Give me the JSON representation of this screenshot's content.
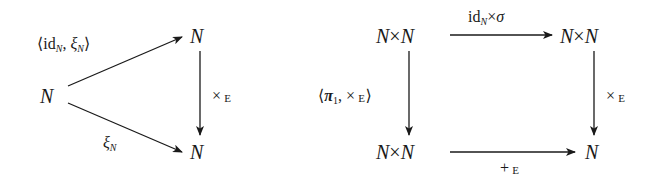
{
  "diagrams": [
    {
      "name": "triangle",
      "objects": {
        "source": "N",
        "top": "N",
        "bottom": "N"
      },
      "morphisms": {
        "source_to_top": {
          "open": "⟨",
          "id": "id",
          "id_sub": "N",
          "sep": ", ",
          "xi": "ξ",
          "xi_sub": "N",
          "close": "⟩"
        },
        "source_to_bottom": {
          "xi": "ξ",
          "xi_sub": "N"
        },
        "top_to_bottom": {
          "op": "×",
          "sub": "E"
        }
      }
    },
    {
      "name": "square",
      "objects": {
        "top_left": {
          "a": "N",
          "op": "×",
          "b": "N"
        },
        "top_right": {
          "a": "N",
          "op": "×",
          "b": "N"
        },
        "bottom_left": {
          "a": "N",
          "op": "×",
          "b": "N"
        },
        "bottom_right": "N"
      },
      "morphisms": {
        "top": {
          "id": "id",
          "id_sub": "N",
          "op": "×",
          "sigma": "σ"
        },
        "left": {
          "open": "⟨",
          "pi": "π",
          "pi_sub": "1",
          "sep": ", ",
          "op": "×",
          "sub": "E",
          "close": "⟩"
        },
        "right": {
          "op": "×",
          "sub": "E"
        },
        "bottom": {
          "op": "+",
          "sub": "E"
        }
      }
    }
  ]
}
